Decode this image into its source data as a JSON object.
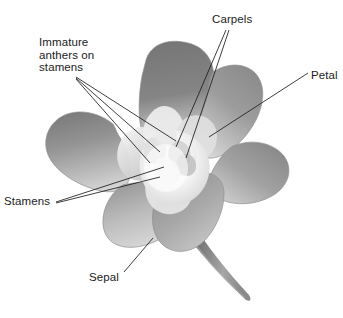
{
  "figure": {
    "type": "botanical-diagram",
    "background_color": "#ffffff",
    "line_color": "#1c1c1c",
    "text_color": "#1c1c1c"
  },
  "labels": {
    "carpels": "Carpels",
    "immature_anthers": "Immature\nanthers on\nstamens",
    "petal": "Petal",
    "stamens": "Stamens",
    "sepal": "Sepal"
  },
  "parts": {
    "petal_dark": "#7b7b7b",
    "petal_mid": "#9a9a9a",
    "petal_light": "#c9c9c9",
    "petal_pale": "#e3e3e3",
    "center_white": "#fbfbfb",
    "center_shadow": "#d3d3d3",
    "stem_dark": "#6f6f6f",
    "stem_light": "#a8a8a8",
    "outline": "#8d8d8d"
  },
  "leader_lines": {
    "carpels_count": 2,
    "immature_anthers_count": 3,
    "petal_count": 1,
    "stamens_count": 2,
    "sepal_count": 1
  }
}
